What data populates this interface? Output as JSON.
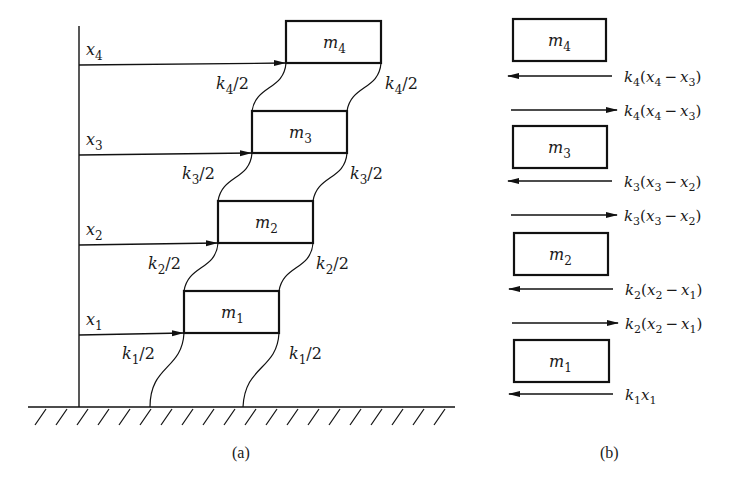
{
  "figure": {
    "panel_a": {
      "caption": "(a)",
      "masses": [
        {
          "name": "m",
          "sub": "4"
        },
        {
          "name": "m",
          "sub": "3"
        },
        {
          "name": "m",
          "sub": "2"
        },
        {
          "name": "m",
          "sub": "1"
        }
      ],
      "displacements": [
        {
          "name": "x",
          "sub": "4"
        },
        {
          "name": "x",
          "sub": "3"
        },
        {
          "name": "x",
          "sub": "2"
        },
        {
          "name": "x",
          "sub": "1"
        }
      ],
      "springs": [
        {
          "name": "k",
          "sub": "4",
          "suffix": "/2"
        },
        {
          "name": "k",
          "sub": "3",
          "suffix": "/2"
        },
        {
          "name": "k",
          "sub": "2",
          "suffix": "/2"
        },
        {
          "name": "k",
          "sub": "1",
          "suffix": "/2"
        }
      ]
    },
    "panel_b": {
      "caption": "(b)",
      "masses": [
        {
          "name": "m",
          "sub": "4"
        },
        {
          "name": "m",
          "sub": "3"
        },
        {
          "name": "m",
          "sub": "2"
        },
        {
          "name": "m",
          "sub": "1"
        }
      ],
      "forces": [
        {
          "k": "4",
          "a": "4",
          "b": "3",
          "direction": "left"
        },
        {
          "k": "4",
          "a": "4",
          "b": "3",
          "direction": "right"
        },
        {
          "k": "3",
          "a": "3",
          "b": "2",
          "direction": "left"
        },
        {
          "k": "3",
          "a": "3",
          "b": "2",
          "direction": "right"
        },
        {
          "k": "2",
          "a": "2",
          "b": "1",
          "direction": "left"
        },
        {
          "k": "2",
          "a": "2",
          "b": "1",
          "direction": "right"
        },
        {
          "k": "1",
          "a": "1",
          "b": "",
          "direction": "left"
        }
      ],
      "symbols": {
        "k": "k",
        "x": "x",
        "minus": "−",
        "open": "(",
        "close": ")"
      }
    }
  }
}
